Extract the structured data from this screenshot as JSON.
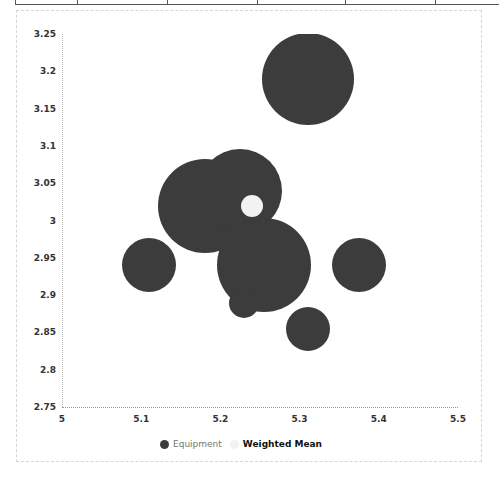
{
  "chart_data": {
    "type": "bubble",
    "title": "",
    "xlabel": "",
    "ylabel": "",
    "xlim": [
      5,
      5.5
    ],
    "ylim": [
      2.75,
      3.25
    ],
    "grid": false,
    "legend_position": "bottom",
    "x_ticks": [
      "5",
      "5.1",
      "5.2",
      "5.3",
      "5.4",
      "5.5"
    ],
    "y_ticks": [
      "3.25",
      "3.2",
      "3.15",
      "3.1",
      "3.05",
      "3",
      "2.95",
      "2.9",
      "2.85",
      "2.8",
      "2.75"
    ],
    "series": [
      {
        "name": "Equipment",
        "color": "#3c3c3c",
        "points": [
          {
            "x": 5.31,
            "y": 3.19,
            "size": 46
          },
          {
            "x": 5.18,
            "y": 3.02,
            "size": 47
          },
          {
            "x": 5.225,
            "y": 3.04,
            "size": 42
          },
          {
            "x": 5.255,
            "y": 2.94,
            "size": 47
          },
          {
            "x": 5.23,
            "y": 2.89,
            "size": 15
          },
          {
            "x": 5.11,
            "y": 2.94,
            "size": 27
          },
          {
            "x": 5.375,
            "y": 2.94,
            "size": 27
          },
          {
            "x": 5.31,
            "y": 2.855,
            "size": 22
          }
        ]
      },
      {
        "name": "Weighted Mean",
        "color": "#f2f2f2",
        "points": [
          {
            "x": 5.24,
            "y": 3.02,
            "size": 11
          }
        ]
      }
    ]
  },
  "legend": {
    "equipment_label": "Equipment",
    "mean_label": "Weighted Mean"
  }
}
